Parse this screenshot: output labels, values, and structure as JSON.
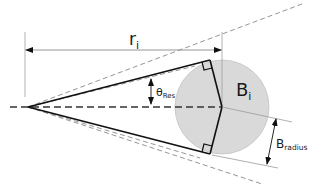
{
  "diagram": {
    "labels": {
      "r_main": "r",
      "r_sub": "i",
      "b_main": "B",
      "b_sub": "i",
      "theta_main": "θ",
      "theta_sub": "Res",
      "bradius_main": "B",
      "bradius_sub": "radius"
    },
    "colors": {
      "background": "#ffffff",
      "solid_line": "#111111",
      "dashed_line": "#444444",
      "thin_dashed_line": "#8a8a8a",
      "dimension_line": "#9a9a9a",
      "circle_fill": "#d9d9d9",
      "circle_stroke": "#bdbdbd"
    }
  }
}
